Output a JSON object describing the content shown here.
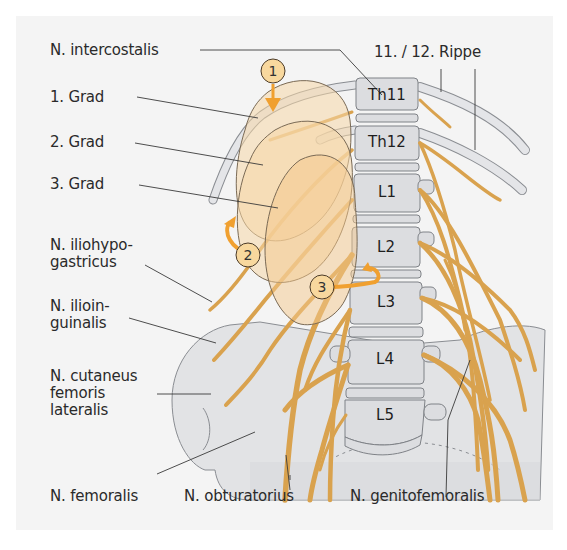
{
  "figure": {
    "background_color": "#f4f4f4",
    "nerve_color": "#d9a24e",
    "bone_color": "#dcdde0",
    "kidney_color": "#f6d7a8",
    "arrow_color": "#f0a030"
  },
  "labels": {
    "n_intercostalis": "N. intercostalis",
    "grad1": "1. Grad",
    "grad2": "2. Grad",
    "grad3": "3. Grad",
    "n_iliohypogastricus": "N. iliohypo-\ngastricus",
    "n_ilioinguinalis": "N. ilioin-\nguinalis",
    "n_cutaneus": "N. cutaneus\nfemoris\nlateralis",
    "n_femoralis": "N. femoralis",
    "n_obturatorius": "N. obturatorius",
    "n_genitofemoralis": "N. genitofemoralis",
    "rippe": "11. / 12. Rippe"
  },
  "vertebrae": [
    {
      "id": "Th11",
      "label": "Th11"
    },
    {
      "id": "Th12",
      "label": "Th12"
    },
    {
      "id": "L1",
      "label": "L1"
    },
    {
      "id": "L2",
      "label": "L2"
    },
    {
      "id": "L3",
      "label": "L3"
    },
    {
      "id": "L4",
      "label": "L4"
    },
    {
      "id": "L5",
      "label": "L5"
    }
  ],
  "markers": [
    {
      "number": "1",
      "meaning": "downward displacement"
    },
    {
      "number": "2",
      "meaning": "rotation"
    },
    {
      "number": "3",
      "meaning": "rotation"
    }
  ]
}
